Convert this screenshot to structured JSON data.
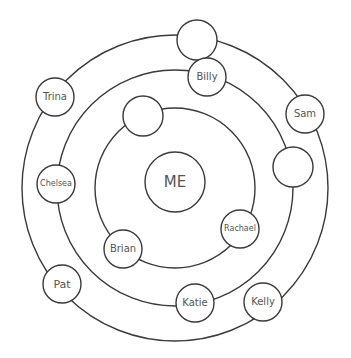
{
  "diagram": {
    "type": "social-circles",
    "center": {
      "x": 175,
      "y": 188
    },
    "rings": [
      {
        "name": "inner-ring",
        "r": 80
      },
      {
        "name": "middle-ring",
        "r": 118
      },
      {
        "name": "outer-ring",
        "r": 153
      }
    ],
    "stroke_color": "#3a3a3a",
    "text_color": "#555555",
    "nodes": [
      {
        "id": "me",
        "label": "ME",
        "x": 175,
        "y": 182,
        "r": 30,
        "font": 15
      },
      {
        "id": "blank-outer-top",
        "label": "",
        "x": 197,
        "y": 40,
        "r": 20,
        "font": 10
      },
      {
        "id": "billy",
        "label": "Billy",
        "x": 207,
        "y": 77,
        "r": 19,
        "font": 10
      },
      {
        "id": "trina",
        "label": "Trina",
        "x": 55,
        "y": 97,
        "r": 19,
        "font": 10
      },
      {
        "id": "sam",
        "label": "Sam",
        "x": 305,
        "y": 114,
        "r": 19,
        "font": 10
      },
      {
        "id": "blank-inner-top",
        "label": "",
        "x": 143,
        "y": 116,
        "r": 20,
        "font": 10
      },
      {
        "id": "blank-middle-right",
        "label": "",
        "x": 293,
        "y": 167,
        "r": 20,
        "font": 10
      },
      {
        "id": "chelsea",
        "label": "Chelsea",
        "x": 56,
        "y": 184,
        "r": 19,
        "font": 8
      },
      {
        "id": "rachael",
        "label": "Rachael",
        "x": 240,
        "y": 229,
        "r": 19,
        "font": 8
      },
      {
        "id": "brian",
        "label": "Brian",
        "x": 123,
        "y": 249,
        "r": 19,
        "font": 10
      },
      {
        "id": "pat",
        "label": "Pat",
        "x": 62,
        "y": 284,
        "r": 19,
        "font": 11
      },
      {
        "id": "katie",
        "label": "Katie",
        "x": 195,
        "y": 303,
        "r": 19,
        "font": 10
      },
      {
        "id": "kelly",
        "label": "Kelly",
        "x": 263,
        "y": 302,
        "r": 19,
        "font": 10
      }
    ]
  }
}
